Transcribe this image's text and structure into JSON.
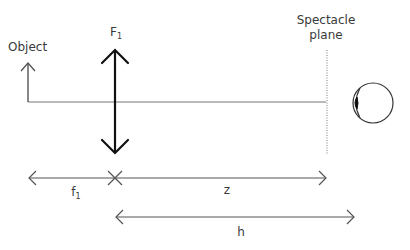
{
  "diagram": {
    "labels": {
      "object": "Object",
      "lens_main": "F",
      "lens_sub": "1",
      "spectacle_plane_line1": "Spectacle",
      "spectacle_plane_line2": "plane",
      "focal_main": "f",
      "focal_sub": "1",
      "z": "z",
      "h": "h"
    },
    "colors": {
      "line": "#555555",
      "lens": "#111111",
      "text": "#3a3a3a"
    }
  }
}
